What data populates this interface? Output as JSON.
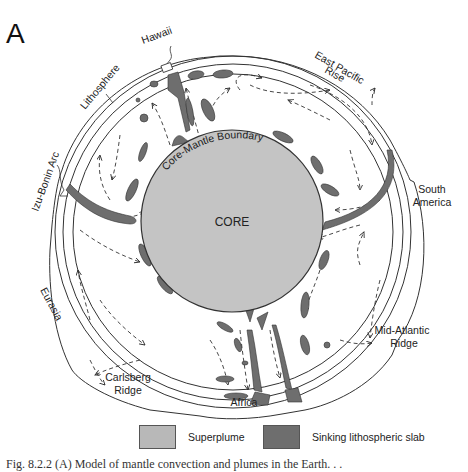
{
  "figure": {
    "panel_letter": "A",
    "core_label": "CORE",
    "boundary_label": "Core-Mantle Boundary",
    "labels": {
      "hawaii": "Hawaii",
      "lithosphere": "Lithosphere",
      "east_pacific_rise_line1": "East Pacific",
      "east_pacific_rise_line2": "Rise",
      "izu_bonin_arc": "Izu-Bonin Arc",
      "south_america_line1": "South",
      "south_america_line2": "America",
      "eurasia": "Eurasia",
      "mid_atlantic_ridge_line1": "Mid-Atlantic",
      "mid_atlantic_ridge_line2": "Ridge",
      "carlsberg_ridge_line1": "Carlsberg",
      "carlsberg_ridge_line2": "Ridge",
      "africa": "Africa"
    },
    "colors": {
      "core_fill": "#c4c4c4",
      "superplume_fill": "#b8b8b8",
      "slab_fill": "#6e6e6e",
      "line": "#333333"
    }
  },
  "legend": {
    "items": [
      {
        "label": "Superplume",
        "color": "#b8b8b8"
      },
      {
        "label": "Sinking lithospheric slab",
        "color": "#6e6e6e"
      }
    ]
  },
  "caption": {
    "text": "Fig. 8.2.2  (A) Model of mantle convection and plumes in the Earth. . ."
  }
}
